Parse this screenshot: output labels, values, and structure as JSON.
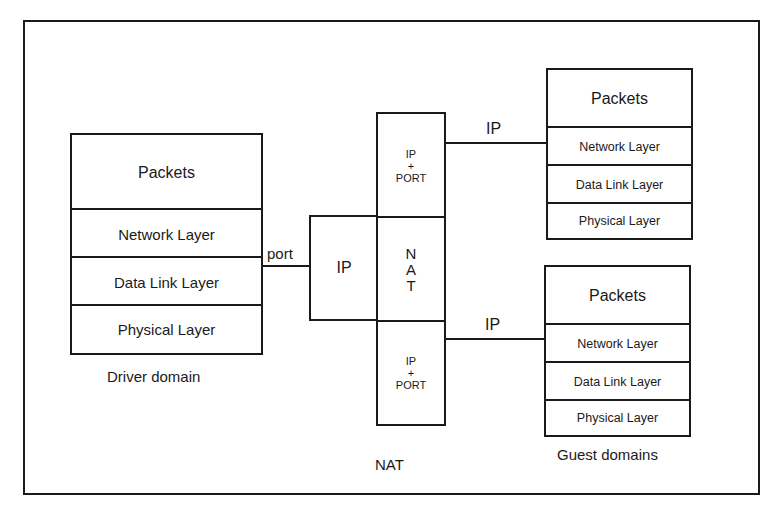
{
  "diagram": {
    "frame_label": "NAT",
    "driver_domain": {
      "label": "Driver domain",
      "layers": [
        "Packets",
        "Network Layer",
        "Data Link Layer",
        "Physical Layer"
      ]
    },
    "connections": {
      "driver_to_nat": "port",
      "nat_to_guest_top": "IP",
      "nat_to_guest_bottom": "IP"
    },
    "nat_block": {
      "ip_box": "IP",
      "nat_letters": [
        "N",
        "A",
        "T"
      ],
      "top_cell": [
        "IP",
        "+",
        "PORT"
      ],
      "bottom_cell": [
        "IP",
        "+",
        "PORT"
      ]
    },
    "guest_domains": {
      "label": "Guest domains",
      "stacks": [
        {
          "layers": [
            "Packets",
            "Network Layer",
            "Data Link Layer",
            "Physical Layer"
          ]
        },
        {
          "layers": [
            "Packets",
            "Network Layer",
            "Data Link Layer",
            "Physical Layer"
          ]
        }
      ]
    }
  }
}
